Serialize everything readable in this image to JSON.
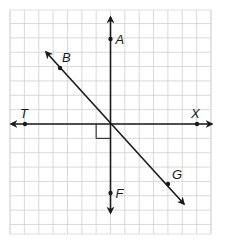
{
  "diagram": {
    "grid": {
      "columns": 14,
      "rows": 16
    },
    "points": [
      {
        "id": "A",
        "label": "A",
        "gx": 0,
        "gy": 6
      },
      {
        "id": "F",
        "label": "F",
        "gx": 0,
        "gy": -5
      },
      {
        "id": "T",
        "label": "T",
        "gx": -6,
        "gy": 0
      },
      {
        "id": "X",
        "label": "X",
        "gx": 6,
        "gy": 0
      },
      {
        "id": "B",
        "label": "B",
        "gx": -3.5,
        "gy": 4
      },
      {
        "id": "G",
        "label": "G",
        "gx": 4,
        "gy": -4.2
      }
    ],
    "lines": [
      {
        "id": "line-AF",
        "name": "vertical-line-af",
        "through": [
          "A",
          "F"
        ],
        "arrows": "both"
      },
      {
        "id": "line-TX",
        "name": "horizontal-line-tx",
        "through": [
          "T",
          "X"
        ],
        "arrows": "both"
      },
      {
        "id": "line-BG",
        "name": "diagonal-line-bg",
        "through": [
          "B",
          "G"
        ],
        "arrows": "both"
      }
    ],
    "right_angle_marker": {
      "between": [
        "T",
        "F"
      ],
      "quadrant": "lower-left"
    }
  }
}
